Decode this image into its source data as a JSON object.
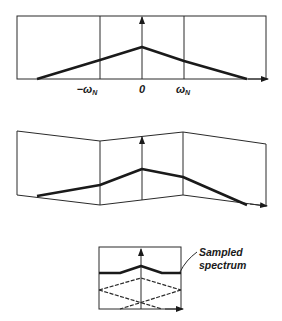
{
  "figure": {
    "panels": [
      {
        "name": "continuous-spectrum",
        "description": "Original spectrum extending beyond Nyquist frequency",
        "tick_labels": {
          "neg_nyquist": "−ω",
          "neg_nyquist_sub": "N",
          "zero": "0",
          "pos_nyquist": "ω",
          "pos_nyquist_sub": "N"
        }
      },
      {
        "name": "folded-spectrum",
        "description": "Spectrum folded at ±ω_N"
      },
      {
        "name": "sampled-spectrum",
        "description": "Aliased components summing to sampled spectrum",
        "annotation_line1": "Sampled",
        "annotation_line2": "spectrum"
      }
    ]
  }
}
